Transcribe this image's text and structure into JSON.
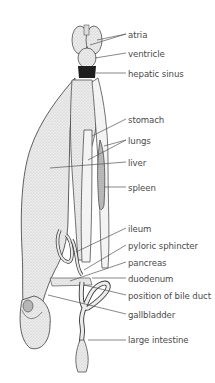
{
  "figure": {
    "labels": [
      {
        "id": "atria",
        "text": "atria",
        "y": 30
      },
      {
        "id": "ventricle",
        "text": "ventricle",
        "y": 49
      },
      {
        "id": "hepatic-sinus",
        "text": "hepatic sinus",
        "y": 69
      },
      {
        "id": "stomach",
        "text": "stomach",
        "y": 115
      },
      {
        "id": "lungs",
        "text": "lungs",
        "y": 136
      },
      {
        "id": "liver",
        "text": "liver",
        "y": 158
      },
      {
        "id": "spleen",
        "text": "spleen",
        "y": 183
      },
      {
        "id": "ileum",
        "text": "ileum",
        "y": 224
      },
      {
        "id": "pyloric-sphincter",
        "text": "pyloric sphincter",
        "y": 241
      },
      {
        "id": "pancreas",
        "text": "pancreas",
        "y": 258
      },
      {
        "id": "duodenum",
        "text": "duodenum",
        "y": 274
      },
      {
        "id": "position-of-bile-duct",
        "text": "position of bile duct",
        "y": 291
      },
      {
        "id": "gallbladder",
        "text": "gallbladder",
        "y": 310
      },
      {
        "id": "large-intestine",
        "text": "large intestine",
        "y": 335
      }
    ],
    "colors": {
      "label_text": "#4a4a4a",
      "leader_line": "#555555",
      "organ_fill": "#e6e6e6",
      "organ_stroke": "#3a3a3a",
      "dark_shade": "#1e1e1e"
    }
  }
}
